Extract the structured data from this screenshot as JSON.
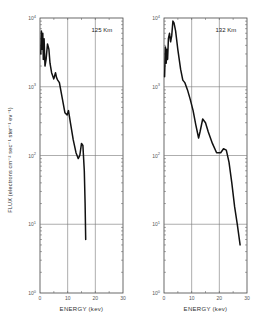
{
  "chart_data": [
    {
      "type": "line",
      "title": "125 Km",
      "xlabel": "ENERGY (kev)",
      "ylabel": "FLUX (electrons cm⁻² sec⁻¹ ster⁻¹ ev⁻¹)",
      "xlim": [
        0,
        30
      ],
      "ylim": [
        1,
        10000
      ],
      "yscale": "log",
      "x_ticks": [
        "0",
        "10",
        "20",
        "30"
      ],
      "y_ticks": [
        "10⁰",
        "10¹",
        "10²",
        "10³",
        "10⁴"
      ],
      "grid": true,
      "series": [
        {
          "name": "125 Km",
          "x": [
            0.3,
            0.5,
            0.8,
            1.0,
            1.2,
            1.5,
            1.8,
            2.2,
            2.7,
            3.2,
            3.6,
            4.2,
            5.0,
            5.6,
            6.0,
            6.4,
            7.0,
            8.0,
            9.0,
            9.8,
            10.3,
            11.0,
            12.0,
            13.0,
            13.8,
            14.4,
            15.0,
            15.5,
            16.0,
            16.3,
            16.5
          ],
          "y": [
            3000,
            6500,
            3500,
            6000,
            2500,
            5000,
            2000,
            2500,
            4200,
            3500,
            2200,
            1600,
            1300,
            1600,
            1350,
            1250,
            1150,
            700,
            420,
            390,
            450,
            300,
            170,
            110,
            90,
            100,
            150,
            140,
            60,
            20,
            6
          ]
        }
      ]
    },
    {
      "type": "line",
      "title": "132 Km",
      "xlabel": "ENERGY (kev)",
      "ylabel": "",
      "xlim": [
        0,
        30
      ],
      "ylim": [
        1,
        10000
      ],
      "yscale": "log",
      "x_ticks": [
        "0",
        "10",
        "20",
        "30"
      ],
      "y_ticks": [
        "10⁰",
        "10¹",
        "10²",
        "10³",
        "10⁴"
      ],
      "grid": true,
      "series": [
        {
          "name": "132 Km",
          "x": [
            0.2,
            0.5,
            0.8,
            1.0,
            1.3,
            1.6,
            2.0,
            2.4,
            2.8,
            3.2,
            3.6,
            4.2,
            5.0,
            6.0,
            6.8,
            7.5,
            8.5,
            9.5,
            10.5,
            11.5,
            12.5,
            13.0,
            14.0,
            15.0,
            16.0,
            17.5,
            19.0,
            20.5,
            21.5,
            22.5,
            23.5,
            24.5,
            25.5,
            26.5,
            27.5
          ],
          "y": [
            1400,
            3800,
            2200,
            3500,
            2500,
            5000,
            6000,
            4500,
            5500,
            9000,
            8500,
            6500,
            3500,
            1800,
            1250,
            1150,
            900,
            650,
            450,
            280,
            180,
            220,
            340,
            300,
            220,
            150,
            110,
            110,
            125,
            120,
            80,
            40,
            18,
            10,
            5
          ]
        }
      ]
    }
  ],
  "panels": [
    {
      "label": "125 Km",
      "xlabel": "ENERGY (kev)",
      "x_ticks": [
        "0",
        "10",
        "20",
        "30"
      ],
      "y_ticks": [
        "0",
        "1",
        "2",
        "3",
        "4"
      ]
    },
    {
      "label": "132 Km",
      "xlabel": "ENERGY (kev)",
      "x_ticks": [
        "0",
        "10",
        "20",
        "30"
      ],
      "y_ticks": [
        "0",
        "1",
        "2",
        "3",
        "4"
      ]
    }
  ],
  "ylabel": "FLUX (electrons cm⁻² sec⁻¹ ster⁻¹ ev⁻¹)",
  "decade_base": "10"
}
